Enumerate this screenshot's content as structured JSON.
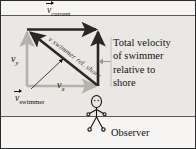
{
  "figure": {
    "background_color": "#f2f1ef",
    "water_color": "#e9e8e5",
    "border_color": "#2b2b2b"
  },
  "labels": {
    "current": {
      "symbol": "v",
      "subscript": "current",
      "vector": true
    },
    "swimmer": {
      "symbol": "v",
      "subscript": "swimmer",
      "vector": true
    },
    "vy": {
      "symbol": "v",
      "subscript": "y",
      "vector": false
    },
    "vx": {
      "symbol": "v",
      "subscript": "x",
      "vector": false
    },
    "diagonal": "v swimmer rel. shore",
    "observer": "Observer"
  },
  "callout": {
    "lines": [
      "Total velocity",
      "of swimmer",
      "relative to",
      "shore"
    ],
    "text": "Total velocity of swimmer relative to shore"
  },
  "vectors": {
    "current": {
      "label": "v_current",
      "color": "#2b2724",
      "direction": "right",
      "from": [
        26,
        28
      ],
      "to": [
        97,
        28
      ]
    },
    "swimmer": {
      "label": "v_swimmer",
      "color": "#2b2724",
      "direction": "up-left",
      "from": [
        97,
        82
      ],
      "to": [
        27,
        29
      ]
    },
    "vy_component": {
      "label": "v_y",
      "color": "#b5b2ad",
      "direction": "up",
      "from": [
        26,
        84
      ],
      "to": [
        26,
        30
      ]
    },
    "vx_component": {
      "label": "v_x",
      "color": "#b5b2ad",
      "direction": "right",
      "from": [
        26,
        84
      ],
      "to": [
        96,
        84
      ]
    },
    "total": {
      "label": "total velocity relative to shore",
      "color": "#2b2724",
      "direction": "up",
      "from": [
        97,
        84
      ],
      "to": [
        97,
        29
      ]
    }
  },
  "observer_figure": {
    "name": "stick-figure-observer",
    "position": [
      86,
      98
    ],
    "color": "#16120f"
  },
  "shorelines": {
    "far_y": 14,
    "near_y": 115,
    "color": "#5a5a58"
  }
}
